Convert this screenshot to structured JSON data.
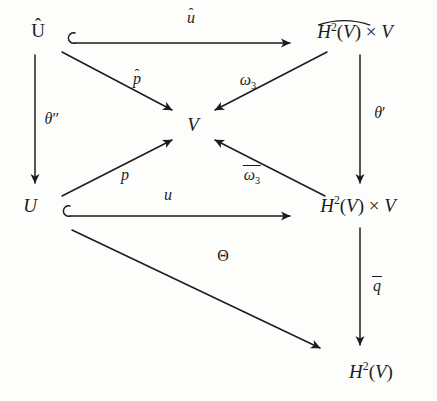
{
  "figure": {
    "kind": "commutative-diagram",
    "background_color": "#fdfdfb",
    "ink_color": "#1c1c1c",
    "width": 437,
    "height": 401
  },
  "nodes": {
    "u_hat": {
      "label": "U",
      "accent": "hat",
      "x": 38,
      "y": 30
    },
    "h2v_hat_times_v": {
      "label": "H2(V) x V",
      "accent": "widehat-on-H2V",
      "x": 355,
      "y": 30
    },
    "v_center": {
      "label": "V",
      "accent": "none",
      "x": 193,
      "y": 124
    },
    "u_plain": {
      "label": "U",
      "accent": "none",
      "x": 30,
      "y": 205
    },
    "h2v_times_v": {
      "label": "H2(V) x V",
      "accent": "none",
      "x": 358,
      "y": 205
    },
    "h2v": {
      "label": "H2(V)",
      "accent": "none",
      "x": 371,
      "y": 371
    }
  },
  "edges": [
    {
      "id": "u-hat-to-h2vhat",
      "label": "u",
      "accent": "hat",
      "style": "hooked-arrow",
      "label_x": 191,
      "label_y": 18
    },
    {
      "id": "u-hat-to-v",
      "label": "p",
      "accent": "hat",
      "style": "arrow",
      "label_x": 137,
      "label_y": 79
    },
    {
      "id": "h2vhat-to-v",
      "label": "ω3",
      "accent": "none",
      "style": "arrow",
      "label_x": 248,
      "label_y": 80
    },
    {
      "id": "u-hat-to-u",
      "label": "θ''",
      "accent": "none",
      "style": "arrow",
      "label_x": 52,
      "label_y": 119
    },
    {
      "id": "h2vhat-to-h2v",
      "label": "θ'",
      "accent": "none",
      "style": "arrow",
      "label_x": 380,
      "label_y": 113
    },
    {
      "id": "u-to-v",
      "label": "p",
      "accent": "none",
      "style": "arrow",
      "label_x": 125,
      "label_y": 175
    },
    {
      "id": "h2v-times-v-to-v",
      "label": "ω3",
      "accent": "overline",
      "style": "arrow",
      "label_x": 252,
      "label_y": 174
    },
    {
      "id": "u-to-h2v-times-v",
      "label": "u",
      "accent": "none",
      "style": "hooked-arrow",
      "label_x": 168,
      "label_y": 195
    },
    {
      "id": "u-to-h2v",
      "label": "Θ",
      "accent": "none",
      "style": "arrow",
      "label_x": 223,
      "label_y": 256
    },
    {
      "id": "h2vtimesv-to-h2v",
      "label": "q",
      "accent": "overline",
      "style": "arrow",
      "label_x": 377,
      "label_y": 285
    }
  ],
  "glyphs": {
    "hat": "̂",
    "times": "×",
    "theta_lower": "θ",
    "theta_upper": "Θ",
    "omega": "ω",
    "prime": "′",
    "double_prime": "″",
    "superscript_two": "2",
    "subscript_three": "3",
    "hook_symbol": "↪"
  }
}
